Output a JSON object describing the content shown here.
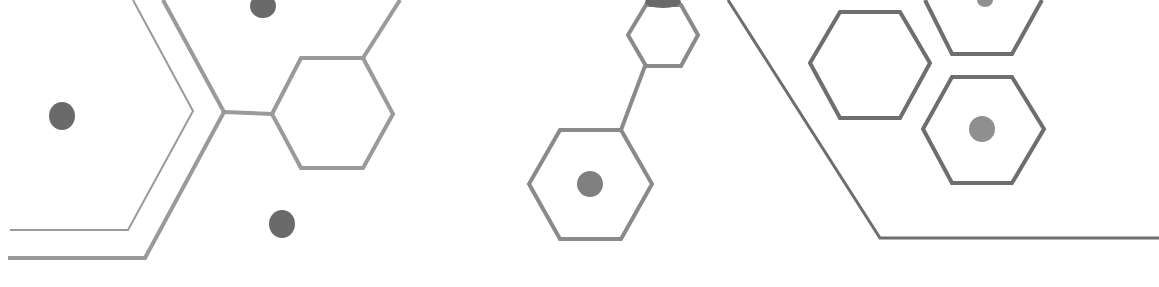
{
  "canvas": {
    "width": 1159,
    "height": 287,
    "background": "#ffffff"
  },
  "colors": {
    "line_light": "#9a9a9a",
    "line_mid": "#8a8a8a",
    "line_dark": "#6e6e6e",
    "dot_dark": "#6a6a6a",
    "dot_mid": "#808080",
    "dot_light": "#8f8f8f"
  },
  "polylines": [
    {
      "name": "left-thin-chevron-line",
      "points": "10,230 128,230 193,111 133,0",
      "stroke": "line_light",
      "width": 2
    },
    {
      "name": "left-thick-chevron-line",
      "points": "8,258 145,258 224,112 163,0",
      "stroke": "line_light",
      "width": 4
    },
    {
      "name": "left-connector-line",
      "points": "224,112 272,114",
      "stroke": "line_light",
      "width": 4
    },
    {
      "name": "hex-a-top-connector-line",
      "points": "363,58 400,0",
      "stroke": "line_light",
      "width": 4
    },
    {
      "name": "middle-connector-line",
      "points": "645,66 621,130",
      "stroke": "line_mid",
      "width": 4
    },
    {
      "name": "right-diagonal-line",
      "points": "728,0 880,238 1159,238",
      "stroke": "line_dark",
      "width": 3
    },
    {
      "name": "hex-e-partial-line",
      "points": "925,0 952,54 1012,54 1042,0",
      "stroke": "line_dark",
      "width": 4
    }
  ],
  "hexagons": [
    {
      "name": "hexagon-a",
      "points": "272,114 301,58 363,58 393,114 363,168 301,168",
      "stroke": "line_light",
      "width": 4
    },
    {
      "name": "hexagon-b",
      "points": "628,35 646,5 681,5 698,35 681,66 646,66",
      "stroke": "line_mid",
      "width": 4
    },
    {
      "name": "hexagon-c",
      "points": "529,184 560,130 621,130 652,184 621,239 560,239",
      "stroke": "line_mid",
      "width": 4
    },
    {
      "name": "hexagon-d",
      "points": "810,63 840,12 900,12 930,63 900,118 840,118",
      "stroke": "line_dark",
      "width": 4
    },
    {
      "name": "hexagon-f",
      "points": "923,129 952,77 1012,77 1044,129 1012,183 952,183",
      "stroke": "line_dark",
      "width": 4
    }
  ],
  "dots": [
    {
      "name": "left-dot",
      "cx": 62,
      "cy": 116,
      "rx": 13,
      "ry": 14,
      "fill": "dot_dark"
    },
    {
      "name": "bottom-left-dot",
      "cx": 282,
      "cy": 224,
      "rx": 13,
      "ry": 14,
      "fill": "dot_dark"
    },
    {
      "name": "top-left-dot",
      "cx": 263,
      "cy": 6,
      "rx": 13,
      "ry": 12,
      "fill": "dot_dark"
    },
    {
      "name": "hexagon-c-dot",
      "cx": 590,
      "cy": 184,
      "rx": 13,
      "ry": 13,
      "fill": "dot_mid"
    },
    {
      "name": "hexagon-f-dot",
      "cx": 982,
      "cy": 129,
      "rx": 13,
      "ry": 13,
      "fill": "dot_light"
    },
    {
      "name": "top-right-dot",
      "cx": 985,
      "cy": 0,
      "rx": 8,
      "ry": 7,
      "fill": "dot_light"
    },
    {
      "name": "hexagon-b-top-blob",
      "cx": 663,
      "cy": 2,
      "rx": 18,
      "ry": 6,
      "fill": "dot_dark"
    }
  ]
}
